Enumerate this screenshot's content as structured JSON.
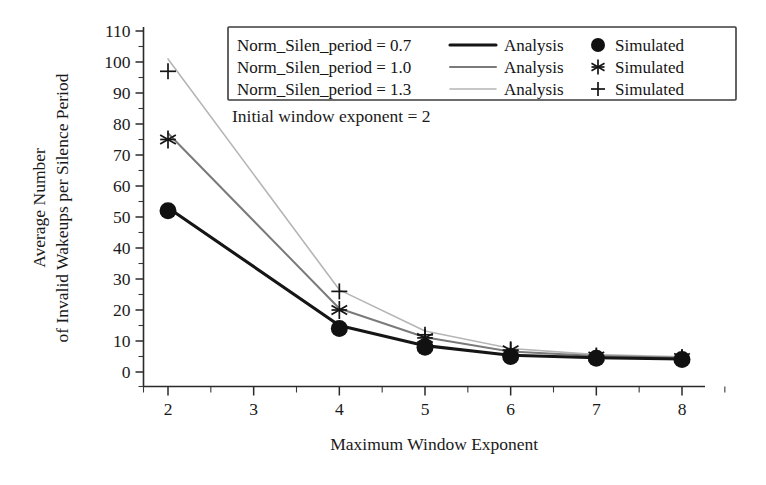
{
  "chart_data": {
    "type": "line",
    "title": "",
    "xlabel": "Maximum Window Exponent",
    "ylabel_line1": "Average Number",
    "ylabel_line2": "of Invalid Wakeups per Silence Period",
    "xlim": [
      1.7,
      8.4
    ],
    "ylim": [
      -3,
      113
    ],
    "xticks": [
      2,
      3,
      4,
      5,
      6,
      7,
      8
    ],
    "xtick_labels": [
      "2",
      "3",
      "4",
      "5",
      "6",
      "7",
      "8"
    ],
    "yticks": [
      0,
      10,
      20,
      30,
      40,
      50,
      60,
      70,
      80,
      90,
      100,
      110
    ],
    "ytick_labels": [
      "0",
      "10",
      "20",
      "30",
      "40",
      "50",
      "60",
      "70",
      "80",
      "90",
      "100",
      "110"
    ],
    "x_minor_step": 0.5,
    "y_minor_step": 5,
    "grid": false,
    "legend_position": "top-center",
    "annotation": "Initial window exponent = 2",
    "x": [
      2,
      4,
      5,
      6,
      7,
      8
    ],
    "series": [
      {
        "name": "Norm_Silen_period = 0.7",
        "analysis_label": "Analysis",
        "simulated_label": "Simulated",
        "marker": "circle",
        "color": "#151515",
        "line_width": 3.1,
        "analysis_values": [
          53,
          15,
          8.5,
          5.4,
          4.6,
          4.2
        ],
        "simulated_values": [
          52,
          14,
          8,
          5,
          4.4,
          4
        ]
      },
      {
        "name": "Norm_Silen_period = 1.0",
        "analysis_label": "Analysis",
        "simulated_label": "Simulated",
        "marker": "asterisk",
        "color": "#7a7a7a",
        "line_width": 2.0,
        "analysis_values": [
          77,
          20.5,
          11.2,
          6.6,
          5.2,
          4.6
        ],
        "simulated_values": [
          75,
          20,
          11,
          7,
          5,
          4.5
        ]
      },
      {
        "name": "Norm_Silen_period = 1.3",
        "analysis_label": "Analysis",
        "simulated_label": "Simulated",
        "marker": "plus",
        "color": "#b5b5b5",
        "line_width": 1.6,
        "analysis_values": [
          101,
          26.5,
          13.2,
          7.6,
          5.6,
          4.9
        ],
        "simulated_values": [
          97,
          26,
          12,
          7,
          5,
          4.5
        ]
      }
    ]
  },
  "colors": {
    "axis": "#2a2a2a",
    "text": "#1a1a1a",
    "series_dark": "#151515",
    "series_mid": "#7a7a7a",
    "series_light": "#b5b5b5",
    "background": "#ffffff"
  }
}
